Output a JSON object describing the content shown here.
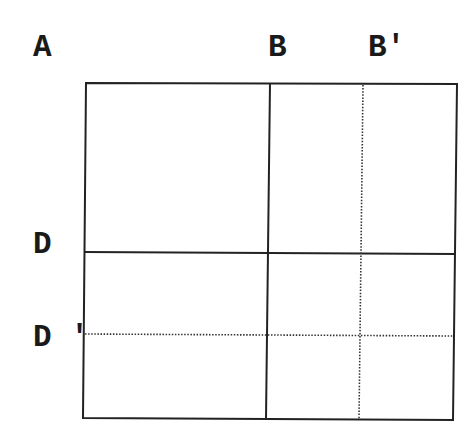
{
  "diagram": {
    "type": "partitioned-square",
    "labels": {
      "A": "A",
      "B": "B",
      "B_prime": "B′",
      "D": "D",
      "D_prime": "D ′"
    },
    "line_color": "#222222",
    "background": "#ffffff",
    "outer_box": {
      "top_left": [
        86,
        83
      ],
      "top_right": [
        457,
        84
      ],
      "bottom_right": [
        453,
        420
      ],
      "bottom_left": [
        83,
        418
      ]
    },
    "solid_lines": [
      {
        "name": "B",
        "orientation": "vertical",
        "from": [
          270,
          83
        ],
        "to": [
          266,
          419
        ]
      },
      {
        "name": "D",
        "orientation": "horizontal",
        "from": [
          84,
          252
        ],
        "to": [
          455,
          254
        ]
      }
    ],
    "dotted_lines": [
      {
        "name": "B_prime",
        "orientation": "vertical",
        "from": [
          363,
          84
        ],
        "to": [
          359,
          420
        ]
      },
      {
        "name": "D_prime",
        "orientation": "horizontal",
        "from": [
          84,
          334
        ],
        "to": [
          454,
          336
        ]
      }
    ]
  }
}
